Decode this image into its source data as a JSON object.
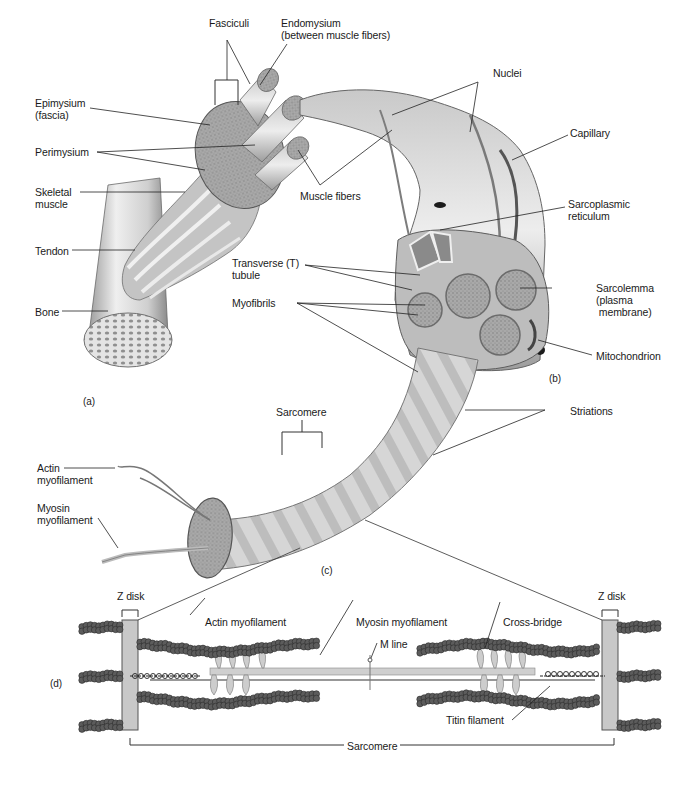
{
  "figure": {
    "panels": [
      "(a)",
      "(b)",
      "(c)",
      "(d)"
    ]
  },
  "labels": {
    "fasciculi": "Fasciculi",
    "endomysium": "Endomysium\n(between muscle fibers)",
    "epimysium": "Epimysium\n(fascia)",
    "perimysium": "Perimysium",
    "skeletal_muscle": "Skeletal\nmuscle",
    "tendon": "Tendon",
    "bone": "Bone",
    "muscle_fibers": "Muscle fibers",
    "nuclei": "Nuclei",
    "capillary": "Capillary",
    "sarcoplasmic_reticulum": "Sarcoplasmic\nreticulum",
    "transverse_tubule": "Transverse (T)\ntubule",
    "myofibrils": "Myofibrils",
    "sarcolemma": "Sarcolemma\n(plasma\n membrane)",
    "mitochondrion": "Mitochondrion",
    "striations": "Striations",
    "sarcomere_c": "Sarcomere",
    "actin_myofilament_c": "Actin\nmyofilament",
    "myosin_myofilament_c": "Myosin\nmyofilament",
    "z_disk_left": "Z disk",
    "z_disk_right": "Z disk",
    "actin_myofilament_d": "Actin myofilament",
    "myosin_myofilament_d": "Myosin myofilament",
    "m_line": "M line",
    "cross_bridge": "Cross-bridge",
    "titin_filament": "Titin filament",
    "sarcomere_d": "Sarcomere"
  },
  "colors": {
    "ink": "#1a1a1a",
    "tissue_light": "#d8d8d8",
    "tissue_mid": "#a8a8a8",
    "tissue_dark": "#6e6e6e",
    "bead": "#5a5a5a"
  }
}
